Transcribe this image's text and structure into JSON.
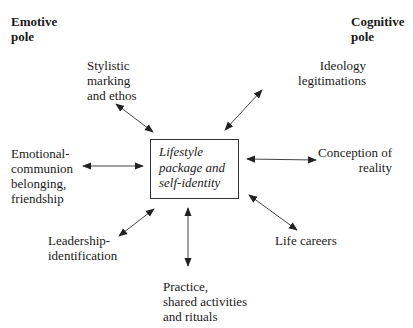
{
  "poles": {
    "emotive": "Emotive\npole",
    "cognitive": "Cognitive\npole"
  },
  "center": {
    "label": "Lifestyle\npackage and\nself-identity"
  },
  "nodes": {
    "stylistic": "Stylistic\nmarking\nand ethos",
    "ideology": "Ideology\nlegitimations",
    "emotional": "Emotional-\ncommunion\nbelonging,\nfriendship",
    "conception": "Conception of\nreality",
    "leadership": "Leadership-\nidentification",
    "life_careers": "Life careers",
    "practice": "Practice,\nshared activities\nand rituals"
  },
  "arrows": [
    {
      "from": "stylistic",
      "to": "center",
      "type": "bidirectional"
    },
    {
      "from": "ideology",
      "to": "center",
      "type": "bidirectional"
    },
    {
      "from": "emotional",
      "to": "center",
      "type": "bidirectional"
    },
    {
      "from": "conception",
      "to": "center",
      "type": "bidirectional"
    },
    {
      "from": "leadership",
      "to": "center",
      "type": "bidirectional"
    },
    {
      "from": "life_careers",
      "to": "center",
      "type": "bidirectional"
    },
    {
      "from": "practice",
      "to": "center",
      "type": "bidirectional"
    }
  ],
  "colors": {
    "line": "#333333",
    "text": "#1a1a1a",
    "background": "#ffffff"
  }
}
